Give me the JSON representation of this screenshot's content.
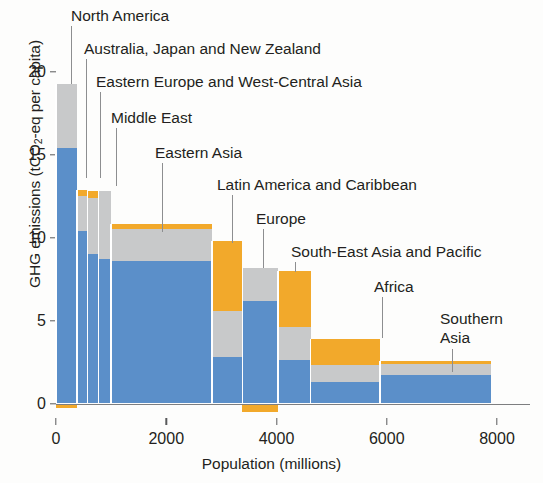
{
  "chart_data": {
    "type": "bar",
    "title": "",
    "subtitle": "",
    "xlabel": "Population (millions)",
    "ylabel": "GHG emissions (tCO2-eq per capita)",
    "xlim": [
      0,
      8000
    ],
    "ylim": [
      -0.6,
      21
    ],
    "x_ticks": [
      0,
      2000,
      4000,
      6000,
      8000
    ],
    "y_ticks": [
      0,
      5,
      10,
      15,
      20
    ],
    "grid": false,
    "legend": null,
    "note": "Marimekko / variable-width stacked bar chart. Bar width = regional population (millions); bar height = GHG emissions per capita (tCO2-eq), stacked by sector colour (blue, grey, orange).",
    "series": [
      {
        "name": "segment-blue",
        "color": "#5b8fc9"
      },
      {
        "name": "segment-grey",
        "color": "#c8c9ca"
      },
      {
        "name": "segment-orange",
        "color": "#f2a92b"
      }
    ],
    "regions": [
      {
        "label": "North America",
        "pop_start": 0,
        "pop_end": 380,
        "blue": 15.4,
        "grey": 3.9,
        "orange": 0.0,
        "negative_orange": -0.25,
        "total": 19.3
      },
      {
        "label": "Australia, Japan and New Zealand",
        "pop_start": 380,
        "pop_end": 570,
        "blue": 10.4,
        "grey": 2.1,
        "orange": 0.4,
        "negative_orange": 0.0,
        "total": 12.9
      },
      {
        "label": "Eastern Europe and West-Central Asia",
        "pop_start": 570,
        "pop_end": 770,
        "blue": 9.0,
        "grey": 3.4,
        "orange": 0.4,
        "negative_orange": 0.0,
        "total": 12.8
      },
      {
        "label": "Middle East",
        "pop_start": 770,
        "pop_end": 1000,
        "blue": 8.7,
        "grey": 4.1,
        "orange": 0.0,
        "negative_orange": 0.0,
        "total": 12.8
      },
      {
        "label": "Eastern Asia",
        "pop_start": 1000,
        "pop_end": 2830,
        "blue": 8.6,
        "grey": 1.9,
        "orange": 0.3,
        "negative_orange": 0.0,
        "total": 10.8
      },
      {
        "label": "Latin America and Caribbean",
        "pop_start": 2830,
        "pop_end": 3380,
        "blue": 2.8,
        "grey": 2.8,
        "orange": 4.2,
        "negative_orange": 0.0,
        "total": 9.8
      },
      {
        "label": "Europe",
        "pop_start": 3380,
        "pop_end": 4030,
        "blue": 6.2,
        "grey": 2.0,
        "orange": 0.0,
        "negative_orange": -0.5,
        "total": 8.2
      },
      {
        "label": "South-East Asia and Pacific",
        "pop_start": 4030,
        "pop_end": 4620,
        "blue": 2.6,
        "grey": 2.0,
        "orange": 3.4,
        "negative_orange": 0.0,
        "total": 8.0
      },
      {
        "label": "Africa",
        "pop_start": 4620,
        "pop_end": 5880,
        "blue": 1.3,
        "grey": 1.0,
        "orange": 1.6,
        "negative_orange": 0.0,
        "total": 3.9
      },
      {
        "label": "Southern Asia",
        "pop_start": 5880,
        "pop_end": 7900,
        "blue": 1.7,
        "grey": 0.7,
        "orange": 0.15,
        "negative_orange": 0.0,
        "total": 2.55
      }
    ],
    "callouts": [
      {
        "label": "North America",
        "text_x": 71,
        "text_y": 6,
        "leader_x": 71,
        "leader_top": 26,
        "leader_bottom": 84
      },
      {
        "label": "Australia, Japan and New Zealand",
        "text_x": 84,
        "text_y": 39,
        "leader_x": 86,
        "leader_top": 59,
        "leader_bottom": 178
      },
      {
        "label": "Eastern Europe and West-Central Asia",
        "text_x": 96,
        "text_y": 72,
        "leader_x": 100,
        "leader_top": 92,
        "leader_bottom": 178
      },
      {
        "label": "Middle East",
        "text_x": 111,
        "text_y": 108,
        "leader_x": 116,
        "leader_top": 128,
        "leader_bottom": 186
      },
      {
        "label": "Eastern Asia",
        "text_x": 155,
        "text_y": 143,
        "leader_x": 162,
        "leader_top": 163,
        "leader_bottom": 232
      },
      {
        "label": "Latin America and Caribbean",
        "text_x": 217,
        "text_y": 175,
        "leader_x": 232,
        "leader_top": 195,
        "leader_bottom": 243
      },
      {
        "label": "Europe",
        "text_x": 256,
        "text_y": 209,
        "leader_x": 263,
        "leader_top": 229,
        "leader_bottom": 268
      },
      {
        "label": "South-East Asia and Pacific",
        "text_x": 291,
        "text_y": 242,
        "leader_x": 295,
        "leader_top": 262,
        "leader_bottom": 272
      },
      {
        "label": "Africa",
        "text_x": 374,
        "text_y": 277,
        "leader_x": 382,
        "leader_top": 297,
        "leader_bottom": 338
      },
      {
        "label": "Southern",
        "text_x": 440,
        "text_y": 309,
        "leader_x": 452,
        "leader_top": 349,
        "leader_bottom": 372
      },
      {
        "label": "Asia",
        "text_x": 440,
        "text_y": 328,
        "leader_x": -1,
        "leader_top": 0,
        "leader_bottom": 0
      }
    ]
  },
  "axis": {
    "y_tick_labels": [
      "20",
      "15",
      "10",
      "5",
      "0"
    ],
    "x_tick_labels": [
      "0",
      "2000",
      "4000",
      "6000",
      "8000"
    ],
    "y_title_pre": "GHG emissions (tCO",
    "y_title_sub": "2",
    "y_title_post": "-eq per capita)",
    "x_title": "Population (millions)"
  }
}
